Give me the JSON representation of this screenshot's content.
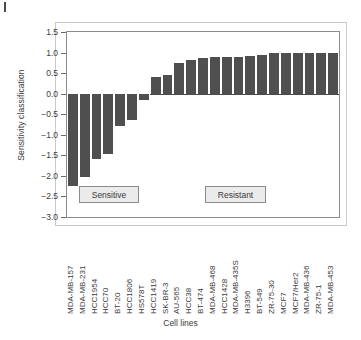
{
  "axis_titles": {
    "y": "Sensitivity classification",
    "x": "Cell lines"
  },
  "annotations": {
    "sensitive_label": "Sensitive",
    "resistant_label": "Resistant"
  },
  "colors": {
    "bar": "#4f4f4f",
    "plot_border": "#8c8c8c",
    "outer_border": "#c9c9c9",
    "annotation_fill": "#ebebeb",
    "text": "#3a3a3a"
  },
  "chart_data": {
    "type": "bar",
    "title": "",
    "xlabel": "Cell lines",
    "ylabel": "Sensitivity classification",
    "ylim": [
      -3.0,
      1.5
    ],
    "yticks": [
      1.5,
      1.0,
      0.5,
      0.0,
      -0.5,
      -1.0,
      -1.5,
      -2.0,
      -2.5,
      -3.0
    ],
    "ytick_labels": [
      "1.5",
      "1.0",
      "0.5",
      "0.0",
      "−0.5",
      "−1.0",
      "−1.5",
      "−2.0",
      "−2.5",
      "−3.0"
    ],
    "grid": false,
    "legend": "none",
    "categories": [
      "MDA-MB-157",
      "MDA-MB-231",
      "HCC1954",
      "HCC70",
      "BT-20",
      "HCC1806",
      "HS578T",
      "HCC1419",
      "SK-BR-3",
      "AU-565",
      "HCC38",
      "BT-474",
      "MDA-MB-468",
      "HCC1428",
      "MDA-MB-435S",
      "H3396",
      "BT-549",
      "ZR-75-30",
      "MCF7",
      "MCF7/Her2",
      "MDA-MB-436",
      "ZR-75-1",
      "MDA-MB-453"
    ],
    "values": [
      -2.25,
      -2.02,
      -1.6,
      -1.47,
      -0.78,
      -0.63,
      -0.15,
      0.41,
      0.45,
      0.74,
      0.82,
      0.86,
      0.88,
      0.89,
      0.9,
      0.92,
      0.95,
      1.0,
      1.0,
      1.0,
      1.0,
      1.0,
      1.0
    ],
    "annotations": [
      {
        "text": "Sensitive",
        "region": "negative bars"
      },
      {
        "text": "Resistant",
        "region": "positive bars"
      }
    ]
  }
}
